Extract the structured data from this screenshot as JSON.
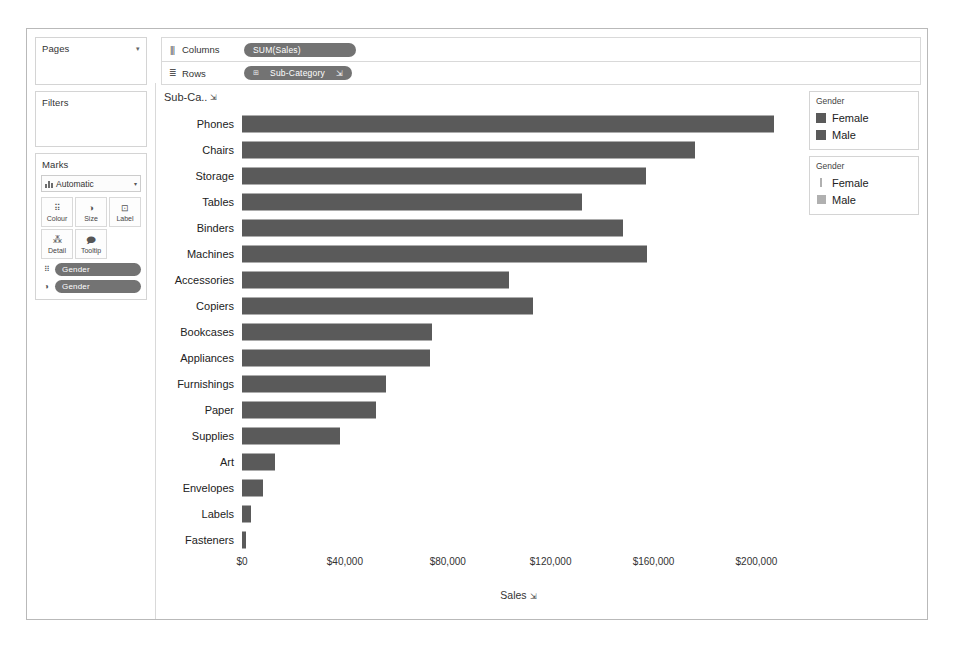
{
  "sidebar": {
    "pages": {
      "title": "Pages",
      "caret": "▾"
    },
    "filters": {
      "title": "Filters"
    },
    "marks": {
      "title": "Marks",
      "type_label": "Automatic",
      "type_caret": "▾",
      "buttons": [
        {
          "label": "Colour",
          "icon": "colour-icon",
          "glyph": "⠿"
        },
        {
          "label": "Size",
          "icon": "size-icon",
          "glyph": "◑"
        },
        {
          "label": "Label",
          "icon": "label-icon",
          "glyph": "⊡"
        },
        {
          "label": "Detail",
          "icon": "detail-icon",
          "glyph": "⁂"
        },
        {
          "label": "Tooltip",
          "icon": "tooltip-icon",
          "glyph": "🗩"
        }
      ],
      "pills": [
        {
          "label": "Gender",
          "icon": "colour-icon",
          "glyph": "⠿"
        },
        {
          "label": "Gender",
          "icon": "size-icon",
          "glyph": "◑"
        }
      ]
    }
  },
  "shelves": [
    {
      "name": "columns",
      "label": "Columns",
      "icon": "columns-icon",
      "glyph": "|||",
      "pill": {
        "text": "SUM(Sales)",
        "prefix": "",
        "sort": ""
      }
    },
    {
      "name": "rows",
      "label": "Rows",
      "icon": "rows-icon",
      "glyph": "≣",
      "pill": {
        "text": "Sub-Category",
        "prefix": "⊞",
        "sort": "⇲"
      }
    }
  ],
  "chart": {
    "field_header": "Sub-Ca..",
    "field_header_sort": "⇲"
  },
  "legends": [
    {
      "name": "colour-legend",
      "title": "Gender",
      "kind": "colour",
      "items": [
        {
          "label": "Female",
          "colour": "#5a5a5a"
        },
        {
          "label": "Male",
          "colour": "#4d4d4d"
        }
      ]
    },
    {
      "name": "size-legend",
      "title": "Gender",
      "kind": "size",
      "items": [
        {
          "label": "Female",
          "size": "sm"
        },
        {
          "label": "Male",
          "size": "lg"
        }
      ]
    }
  ],
  "chart_data": {
    "type": "bar",
    "orientation": "horizontal",
    "title": "",
    "xlabel": "Sales",
    "ylabel": "Sub-Category",
    "xlim": [
      0,
      215000
    ],
    "grid": false,
    "legend_position": "right",
    "tick_values": [
      0,
      40000,
      80000,
      120000,
      160000,
      200000
    ],
    "tick_labels": [
      "$0",
      "$40,000",
      "$80,000",
      "$120,000",
      "$160,000",
      "$200,000"
    ],
    "bar_colour": "#5a5a5a",
    "categories": [
      "Phones",
      "Chairs",
      "Storage",
      "Tables",
      "Binders",
      "Machines",
      "Accessories",
      "Copiers",
      "Bookcases",
      "Appliances",
      "Furnishings",
      "Paper",
      "Supplies",
      "Art",
      "Envelopes",
      "Labels",
      "Fasteners"
    ],
    "values": [
      207000,
      176000,
      157000,
      132000,
      148000,
      157500,
      104000,
      113000,
      74000,
      73000,
      56000,
      52000,
      38000,
      13000,
      8000,
      3500,
      1500
    ]
  }
}
